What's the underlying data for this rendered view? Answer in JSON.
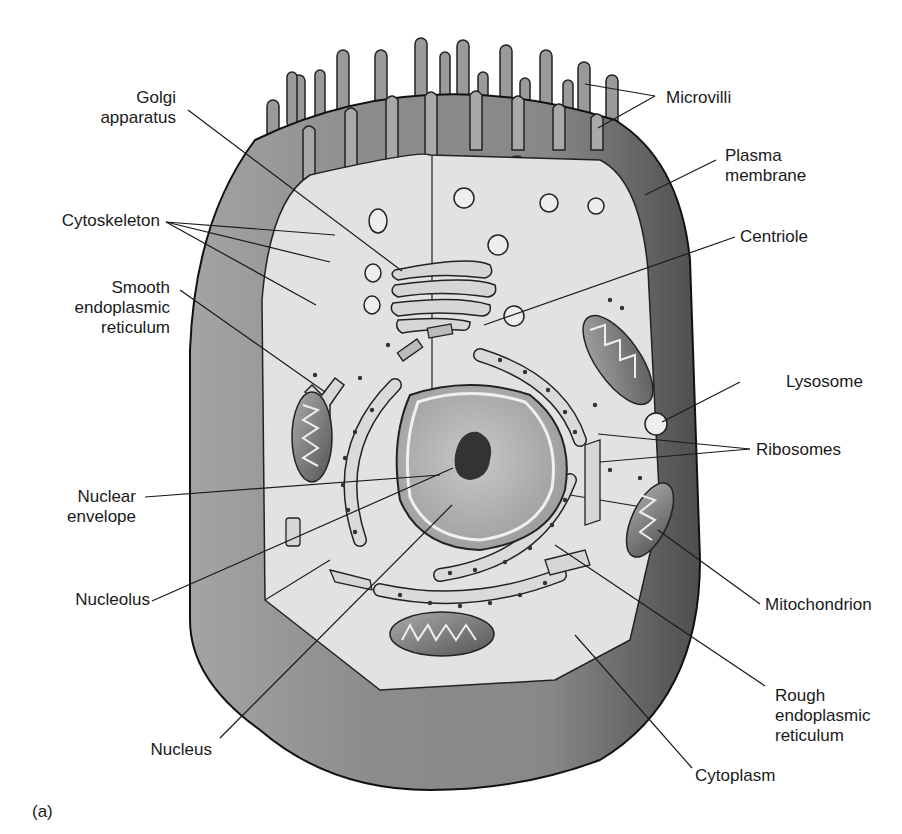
{
  "figure": {
    "panel_label": "(a)"
  },
  "labels": {
    "golgi": "Golgi\napparatus",
    "cytoskeleton": "Cytoskeleton",
    "smooth_er": "Smooth\nendoplasmic\nreticulum",
    "nuclear_envelope": "Nuclear\nenvelope",
    "nucleolus": "Nucleolus",
    "nucleus": "Nucleus",
    "microvilli": "Microvilli",
    "plasma_membrane": "Plasma\nmembrane",
    "centriole": "Centriole",
    "lysosome": "Lysosome",
    "ribosomes": "Ribosomes",
    "mitochondrion": "Mitochondrion",
    "rough_er": "Rough\nendoplasmic\nreticulum",
    "cytoplasm": "Cytoplasm"
  },
  "colors": {
    "outer_shell": "#8a8a8a",
    "outer_shell_dark": "#5e5e5e",
    "inner_face": "#d2d2d2",
    "cytoplasm": "#e4e4e4",
    "nucleus": "#b4b4b4",
    "nucleolus": "#3a3a3a",
    "line": "#1a1a1a"
  }
}
